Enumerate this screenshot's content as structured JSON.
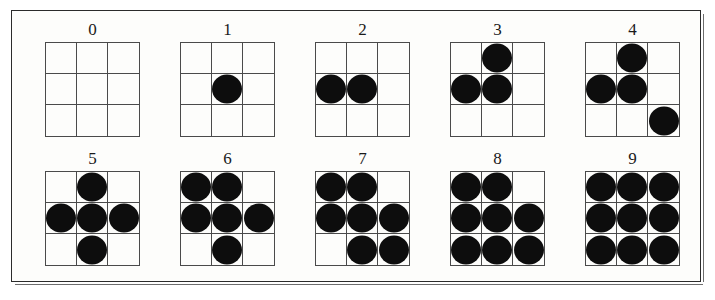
{
  "figure": {
    "frame_color": "#2b2b2b",
    "background_color": "#fdfdfb",
    "dot_color": "#0d0d0d",
    "grid_line_color": "#4a4a4a",
    "rows": 2,
    "columns": 5,
    "grid_size": 3
  },
  "patterns": [
    {
      "label": "0",
      "count": 0,
      "cells": [
        0,
        0,
        0,
        0,
        0,
        0,
        0,
        0,
        0
      ]
    },
    {
      "label": "1",
      "count": 1,
      "cells": [
        0,
        0,
        0,
        0,
        1,
        0,
        0,
        0,
        0
      ]
    },
    {
      "label": "2",
      "count": 2,
      "cells": [
        0,
        0,
        0,
        1,
        1,
        0,
        0,
        0,
        0
      ]
    },
    {
      "label": "3",
      "count": 3,
      "cells": [
        0,
        1,
        0,
        1,
        1,
        0,
        0,
        0,
        0
      ]
    },
    {
      "label": "4",
      "count": 4,
      "cells": [
        0,
        1,
        0,
        1,
        1,
        0,
        0,
        0,
        1
      ]
    },
    {
      "label": "5",
      "count": 5,
      "cells": [
        0,
        1,
        0,
        1,
        1,
        1,
        0,
        1,
        0
      ]
    },
    {
      "label": "6",
      "count": 6,
      "cells": [
        1,
        1,
        0,
        1,
        1,
        1,
        0,
        1,
        0
      ]
    },
    {
      "label": "7",
      "count": 7,
      "cells": [
        1,
        1,
        0,
        1,
        1,
        1,
        0,
        1,
        1
      ]
    },
    {
      "label": "8",
      "count": 8,
      "cells": [
        1,
        1,
        0,
        1,
        1,
        1,
        1,
        1,
        1
      ]
    },
    {
      "label": "9",
      "count": 9,
      "cells": [
        1,
        1,
        1,
        1,
        1,
        1,
        1,
        1,
        1
      ]
    }
  ]
}
